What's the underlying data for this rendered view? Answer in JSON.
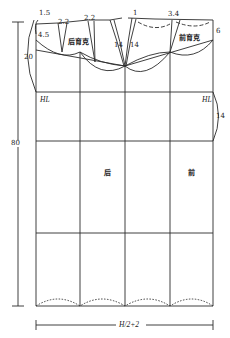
{
  "diagram": {
    "type": "garment-pattern-draft",
    "labels": {
      "dim_1_5": "1.5",
      "dim_2_2_left": "2.2",
      "dim_2_2_right": "2.2",
      "dim_1": "1",
      "dim_3_4": "3.4",
      "dim_6": "6",
      "dim_4_5": "4.5",
      "dim_20": "20",
      "dim_14_left": "14",
      "dim_14_right": "14",
      "dim_14_side": "14",
      "dim_80": "80",
      "hl_left": "HL",
      "hl_right": "HL",
      "back_yoke": "后育克",
      "front_yoke": "前育克",
      "back_panel": "后",
      "front_panel": "前",
      "width_dim": "H/2+2"
    },
    "colors": {
      "line": "#2a2a2a",
      "background": "#ffffff"
    }
  }
}
